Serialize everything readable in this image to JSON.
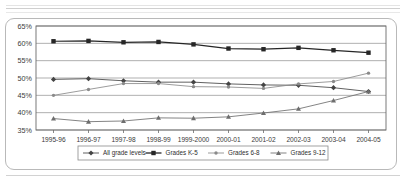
{
  "figure": {
    "frame_color": "#b9b9b9",
    "background": "#ffffff",
    "page_rules": [
      "rule-top-1",
      "rule-top-2",
      "rule-top-3",
      "rule-bottom-1"
    ]
  },
  "chart_data": {
    "type": "line",
    "title": "",
    "subtitle": "",
    "xlabel": "",
    "ylabel": "",
    "ylim": [
      35,
      65
    ],
    "yticks": [
      35,
      40,
      45,
      50,
      55,
      60,
      65
    ],
    "ytick_labels": [
      "35%",
      "40%",
      "45%",
      "50%",
      "55%",
      "60%",
      "65%"
    ],
    "grid": true,
    "grid_axis": "y",
    "legend_position": "bottom",
    "categories": [
      "1995-96",
      "1996-97",
      "1997-98",
      "1998-99",
      "1999-2000",
      "2000-01",
      "2001-02",
      "2002-03",
      "2003-04",
      "2004-05"
    ],
    "series": [
      {
        "name": "All grade levels",
        "marker": "diamond",
        "color": "#444444",
        "values": [
          49.6,
          49.8,
          49.2,
          48.8,
          48.8,
          48.3,
          48.0,
          47.9,
          47.2,
          46.1
        ]
      },
      {
        "name": "Grades K-5",
        "marker": "square",
        "color": "#262626",
        "values": [
          60.6,
          60.7,
          60.3,
          60.4,
          59.7,
          58.5,
          58.3,
          58.7,
          58.0,
          57.3
        ]
      },
      {
        "name": "Grades 6-8",
        "marker": "asterisk",
        "color": "#8a8a8a",
        "values": [
          45.0,
          46.7,
          48.4,
          48.4,
          47.5,
          47.4,
          47.0,
          48.3,
          49.0,
          51.4
        ]
      },
      {
        "name": "Grades 9-12",
        "marker": "triangle",
        "color": "#6e6e6e",
        "values": [
          38.3,
          37.4,
          37.6,
          38.5,
          38.4,
          38.8,
          39.9,
          41.1,
          43.5,
          46.1
        ]
      }
    ]
  }
}
